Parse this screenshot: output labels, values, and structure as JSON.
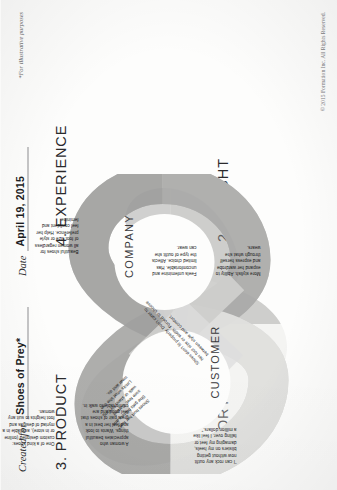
{
  "header": {
    "created_for_label": "Created for",
    "created_for_value": "Shoes of Prey*",
    "date_label": "Date",
    "date_value": "April 19, 2015"
  },
  "notes": {
    "illustrative": "*For illustrative purposes",
    "copyright": "© 2015 Formation Inc. All Rights Reserved."
  },
  "sections": {
    "story": "1. STORY",
    "insight": "2. INSIGHT",
    "product": "3. PRODUCT",
    "experience": "4. EXPERIENCE"
  },
  "hubs": {
    "customer": "CUSTOMER",
    "company": "COMPANY"
  },
  "loop_notes": {
    "story": "A woman who appreciates beautiful things. Wants to look and feel her best in a great pair of shoes that feel good and are comfortable to walk in.",
    "quote": "“I can rock any outfit now without getting blisters on my heels, damaging my feet or falling over. I feel like a million dollars.”",
    "insight": "Feels unfeminine and uncomfortable. Has limited choice. Affects the type of outfit she can wear.",
    "beautiful": "Beautiful shoes for all women regardless of foot size or style preference. Help her feel confident and feminine.",
    "product": "One of a kind shoes: custom designed (online or in store), available in a myriad of designs and foot heights to suit any woman.",
    "pain": "Shoes hurt her feet. She gets blisters and sore feet. Cannot walk or stand for long. Limits what she can wear and do.",
    "cross": "Shoes don't fit properly. Don't cater to her foot size or width. Forced to choose between style and comfort.",
    "experience": "More stylish. Ability to expand her wardrobe and express herself through what she wears."
  },
  "colors": {
    "ribbon_light": "#d9d9d7",
    "ribbon_mid": "#b9b9b7",
    "ribbon_dark": "#9b9b99",
    "ribbon_darker": "#8a8a88",
    "ink": "#2a2a2c",
    "rule": "#8d8d8f"
  }
}
